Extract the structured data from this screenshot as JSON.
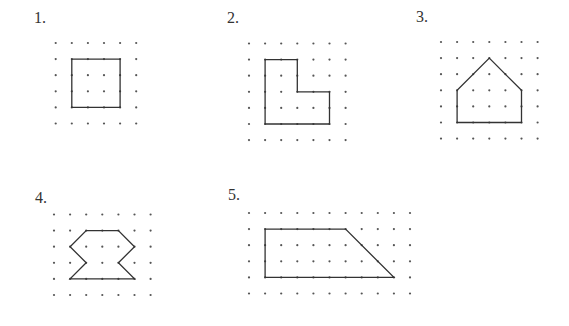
{
  "style": {
    "dot_color": "#555555",
    "dot_radius": 1.1,
    "line_color": "#333333",
    "line_width": 1.3,
    "spacing": 16.1
  },
  "figures": [
    {
      "label": "1.",
      "label_pos": [
        34,
        10
      ],
      "grid_origin": [
        55.7,
        43
      ],
      "cols": 6,
      "rows": 6,
      "shape_name": "square",
      "polygon": [
        [
          1,
          1
        ],
        [
          4,
          1
        ],
        [
          4,
          4
        ],
        [
          1,
          4
        ]
      ]
    },
    {
      "label": "2.",
      "label_pos": [
        227,
        10
      ],
      "grid_origin": [
        249,
        43.5
      ],
      "cols": 7,
      "rows": 7,
      "shape_name": "L-shape",
      "polygon": [
        [
          1,
          1
        ],
        [
          3,
          1
        ],
        [
          3,
          3
        ],
        [
          5,
          3
        ],
        [
          5,
          5
        ],
        [
          1,
          5
        ]
      ]
    },
    {
      "label": "3.",
      "label_pos": [
        416,
        9
      ],
      "grid_origin": [
        441,
        42
      ],
      "cols": 7,
      "rows": 7,
      "shape_name": "pentagon-house",
      "polygon": [
        [
          3,
          1
        ],
        [
          5,
          3
        ],
        [
          5,
          5
        ],
        [
          1,
          5
        ],
        [
          1,
          3
        ]
      ]
    },
    {
      "label": "4.",
      "label_pos": [
        35,
        190
      ],
      "grid_origin": [
        54,
        214.5
      ],
      "cols": 7,
      "rows": 6,
      "shape_name": "hourglass-octagon",
      "polygon": [
        [
          2,
          1
        ],
        [
          4,
          1
        ],
        [
          5,
          2
        ],
        [
          4,
          3
        ],
        [
          5,
          4
        ],
        [
          1,
          4
        ],
        [
          2,
          3
        ],
        [
          1,
          2
        ]
      ]
    },
    {
      "label": "5.",
      "label_pos": [
        228,
        187
      ],
      "grid_origin": [
        249,
        213
      ],
      "cols": 11,
      "rows": 6,
      "shape_name": "trapezoid",
      "polygon": [
        [
          1,
          1
        ],
        [
          6,
          1
        ],
        [
          9,
          4
        ],
        [
          1,
          4
        ]
      ]
    }
  ]
}
